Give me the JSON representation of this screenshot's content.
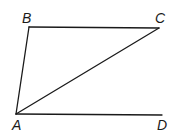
{
  "diagram": {
    "type": "geometry-figure",
    "points": {
      "A": {
        "x": 16,
        "y": 114
      },
      "B": {
        "x": 29,
        "y": 27
      },
      "C": {
        "x": 159,
        "y": 28
      },
      "D": {
        "x": 162,
        "y": 115
      }
    },
    "segments": [
      {
        "id": "AB",
        "from": "A",
        "to": "B"
      },
      {
        "id": "BC",
        "from": "B",
        "to": "C"
      },
      {
        "id": "CA",
        "from": "C",
        "to": "A"
      },
      {
        "id": "AD",
        "from": "A",
        "to": "D"
      }
    ],
    "labels": {
      "A": {
        "text": "A",
        "x": 12,
        "y": 130
      },
      "B": {
        "text": "B",
        "x": 22,
        "y": 23
      },
      "C": {
        "text": "C",
        "x": 155,
        "y": 23
      },
      "D": {
        "text": "D",
        "x": 157,
        "y": 130
      }
    },
    "stroke_color": "#1a1a1a"
  }
}
